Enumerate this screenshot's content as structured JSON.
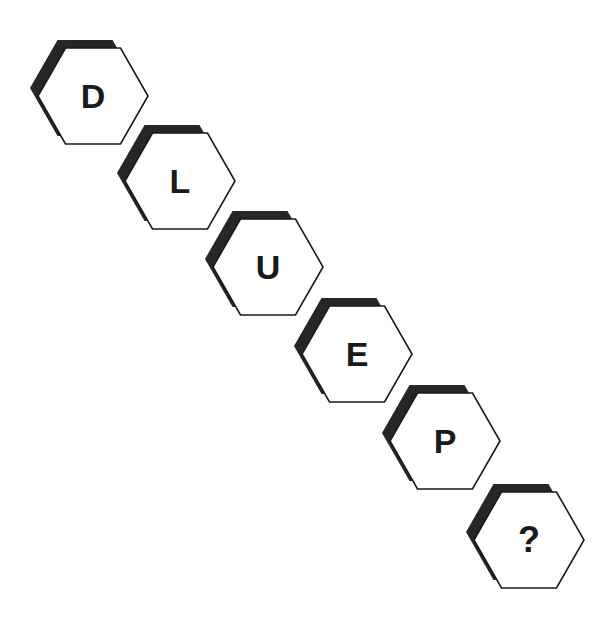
{
  "canvas": {
    "width": 606,
    "height": 629,
    "background_color": "#ffffff"
  },
  "puzzle": {
    "name": "hexagon-letter-sequence",
    "sequence_text": "D L U E P ?",
    "shadow_color": "#262626",
    "outline_color": "#1a1a1a",
    "face_color": "#ffffff",
    "letter_color": "#1a1a1a",
    "cells": [
      {
        "label": "D",
        "x": 30,
        "y": 40,
        "is_unknown": false
      },
      {
        "label": "L",
        "x": 117,
        "y": 125,
        "is_unknown": false
      },
      {
        "label": "U",
        "x": 205,
        "y": 211,
        "is_unknown": false
      },
      {
        "label": "E",
        "x": 294,
        "y": 298,
        "is_unknown": false
      },
      {
        "label": "P",
        "x": 382,
        "y": 385,
        "is_unknown": false
      },
      {
        "label": "?",
        "x": 466,
        "y": 484,
        "is_unknown": true
      }
    ]
  }
}
